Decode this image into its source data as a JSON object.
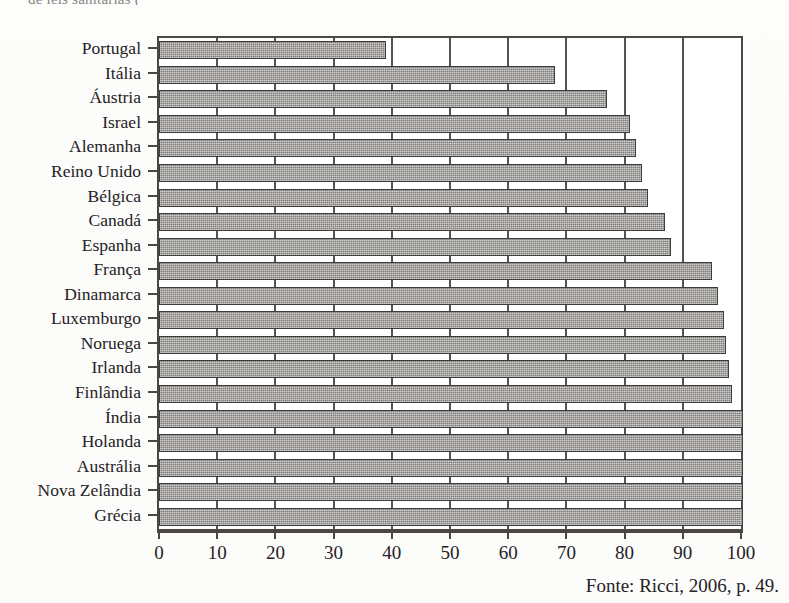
{
  "top_fragment": "de leis sanitárias  (",
  "source_note": "Fonte: Ricci, 2006, p. 49.",
  "axis": {
    "x_ticks": [
      "0",
      "10",
      "20",
      "30",
      "40",
      "50",
      "60",
      "70",
      "80",
      "90",
      "100"
    ]
  },
  "colors": {
    "bar_fill": "#9c9a98",
    "bar_border": "#3f3c39",
    "frame": "#4a4744",
    "text": "#26221f",
    "background": "#ffffff"
  },
  "chart_data": {
    "type": "bar",
    "orientation": "horizontal",
    "title": "",
    "subtitle": "",
    "xlabel": "",
    "ylabel": "",
    "xlim": [
      0,
      100
    ],
    "xticks": [
      0,
      10,
      20,
      30,
      40,
      50,
      60,
      70,
      80,
      90,
      100
    ],
    "grid": "vertical",
    "legend": "none",
    "categories": [
      "Portugal",
      "Itália",
      "Áustria",
      "Israel",
      "Alemanha",
      "Reino Unido",
      "Bélgica",
      "Canadá",
      "Espanha",
      "França",
      "Dinamarca",
      "Luxemburgo",
      "Noruega",
      "Irlanda",
      "Finlândia",
      "Índia",
      "Holanda",
      "Austrália",
      "Nova Zelândia",
      "Grécia"
    ],
    "values": [
      39,
      68,
      77,
      81,
      82,
      83,
      84,
      87,
      88,
      95,
      96,
      97,
      97.5,
      98,
      98.5,
      100,
      100,
      100,
      100,
      100
    ]
  }
}
